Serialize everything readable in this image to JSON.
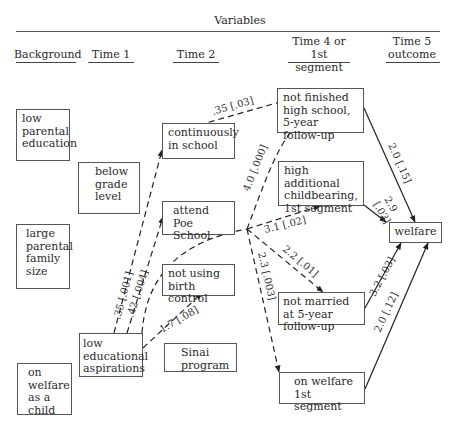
{
  "header": {
    "title": "Variables",
    "columns": [
      "Background",
      "Time 1",
      "Time 2",
      "Time 4 or 1st segment",
      "Time 5 outcome"
    ],
    "col_lines": [
      [
        "Time 4 or",
        "1st segment"
      ],
      [
        "Time 5",
        "outcome"
      ]
    ]
  },
  "nodes": {
    "low_parental_education": "low parental education",
    "large_parental_family_size": "large parental family size",
    "on_welfare_as_child": "on welfare as a child",
    "below_grade_level": "below grade level",
    "low_educational_aspirations": "low educational aspirations",
    "continuously_in_school": "continuously in school",
    "attend_poe_school": "attend Poe School",
    "not_using_birth_control": "not using birth control",
    "sinai_program": "Sinai program",
    "not_finished_high_school": "not finished high school, 5-year follow-up",
    "high_additional_childbearing": "high additional childbearing, 1st segment",
    "not_married": "not married at 5-year follow-up",
    "on_welfare_1st_segment": "on welfare 1st segment",
    "welfare": "welfare"
  },
  "edges": [
    {
      "from": "low_educational_aspirations",
      "to": "continuously_in_school",
      "label": ".35 [.001]",
      "style": "dashed"
    },
    {
      "from": "low_educational_aspirations",
      "to": "attend_poe_school",
      "label": ".42 [.004]",
      "style": "dashed"
    },
    {
      "from": "low_educational_aspirations",
      "to": "not_using_birth_control",
      "label": "1.7 [.08]",
      "style": "dashed"
    },
    {
      "from": "continuously_in_school",
      "to": "not_finished_high_school",
      "label": ".35 [.03]",
      "style": "dashed"
    },
    {
      "from": "low_educational_aspirations",
      "to": "not_finished_high_school",
      "label": "4.0 [.000]",
      "style": "dashed"
    },
    {
      "from": "low_educational_aspirations",
      "to": "high_additional_childbearing",
      "label": "3.1 [.02]",
      "style": "dashed"
    },
    {
      "from": "low_educational_aspirations",
      "to": "not_married",
      "label": "2.2 [.01]",
      "style": "dashed"
    },
    {
      "from": "low_educational_aspirations",
      "to": "on_welfare_1st_segment",
      "label": "2.3 [.003]",
      "style": "dashed"
    },
    {
      "from": "not_finished_high_school",
      "to": "welfare",
      "label": "2.0 [.15]",
      "style": "solid"
    },
    {
      "from": "high_additional_childbearing",
      "to": "welfare",
      "label": "2.9 [.03]",
      "style": "solid"
    },
    {
      "from": "not_married",
      "to": "welfare",
      "label": "3.2 [.03]",
      "style": "solid"
    },
    {
      "from": "on_welfare_1st_segment",
      "to": "welfare",
      "label": "2.0 [.12]",
      "style": "solid"
    }
  ],
  "labels": {
    "e_cont": ".35 [.001]",
    "e_poe": ".42 [.004]",
    "e_bc": "1.7 [.08]",
    "e_nfhs_from_cont": ".35 [.03]",
    "e_nfhs": "4.0 [.000]",
    "e_hac": "3.1 [.02]",
    "e_nm": "2.2 [.01]",
    "e_ow": "2.3 [.003]",
    "w_nfhs": "2.0 [.15]",
    "w_hac_a": "2.9",
    "w_hac_b": "[.03]",
    "w_nm": "3.2 [.03]",
    "w_ow": "2.0 [.12]"
  }
}
